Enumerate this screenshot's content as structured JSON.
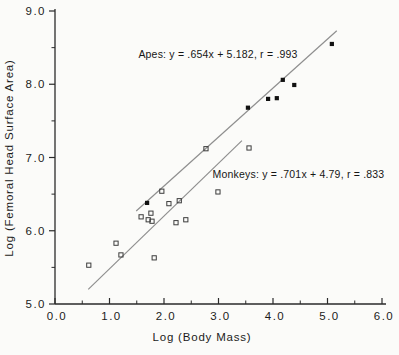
{
  "chart_data": {
    "type": "scatter",
    "title": "",
    "xlabel": "Log (Body Mass)",
    "ylabel": "Log (Femoral Head Surface Area)",
    "xlim": [
      0.0,
      6.0
    ],
    "ylim": [
      5.0,
      9.0
    ],
    "grid": false,
    "xticks": {
      "values": [
        0,
        1,
        2,
        3,
        4,
        5,
        6
      ],
      "labels": [
        "0.0",
        "1.0",
        "2.0",
        "3.0",
        "4.0",
        "5.0",
        "6.0"
      ],
      "minor_step": 0.5
    },
    "yticks": {
      "values": [
        5,
        6,
        7,
        8,
        9
      ],
      "labels": [
        "5.0",
        "6.0",
        "7.0",
        "8.0",
        "9.0"
      ],
      "minor_step": 0.5
    },
    "colors": {
      "axis": "#2a2a2a",
      "fit_line": "#8f8f8f",
      "filled_marker": "#111111",
      "open_marker": "#3c3c3c"
    },
    "series": [
      {
        "name": "Apes",
        "marker": "filled-square",
        "points": [
          [
            1.69,
            6.38
          ],
          [
            3.54,
            7.68
          ],
          [
            3.91,
            7.8
          ],
          [
            4.07,
            7.81
          ],
          [
            4.18,
            8.06
          ],
          [
            4.39,
            7.99
          ],
          [
            5.08,
            8.55
          ]
        ],
        "fit_line": {
          "x1": 1.49,
          "y1": 6.27,
          "x2": 5.17,
          "y2": 8.73
        },
        "annotation": {
          "text": "Apes: y = .654x + 5.182,  r = .993",
          "x": 1.53,
          "y": 8.36
        }
      },
      {
        "name": "Monkeys",
        "marker": "open-square",
        "points": [
          [
            0.62,
            5.53
          ],
          [
            1.12,
            5.83
          ],
          [
            1.21,
            5.67
          ],
          [
            1.58,
            6.19
          ],
          [
            1.71,
            6.15
          ],
          [
            1.76,
            6.24
          ],
          [
            1.78,
            6.13
          ],
          [
            1.82,
            5.63
          ],
          [
            1.96,
            6.54
          ],
          [
            2.09,
            6.37
          ],
          [
            2.22,
            6.11
          ],
          [
            2.28,
            6.41
          ],
          [
            2.4,
            6.15
          ],
          [
            2.77,
            7.12
          ],
          [
            2.99,
            6.53
          ],
          [
            3.56,
            7.13
          ]
        ],
        "fit_line": {
          "x1": 0.61,
          "y1": 5.2,
          "x2": 3.43,
          "y2": 7.23
        },
        "annotation": {
          "text": "Monkeys: y = .701x + 4.79,  r = .833",
          "x": 2.89,
          "y": 6.72
        }
      }
    ]
  }
}
